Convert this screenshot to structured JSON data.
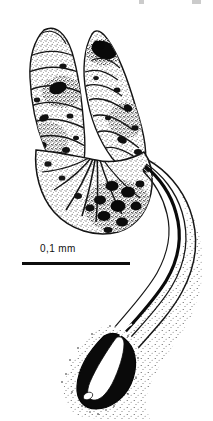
{
  "figure": {
    "domain": "scientific-illustration",
    "technique": "ink stipple and line drawing",
    "background_color": "#ffffff",
    "ink_color": "#111111",
    "width_px": 213,
    "height_px": 421
  },
  "scalebar": {
    "label": "0,1 mm",
    "value": 0.1,
    "unit": "mm",
    "bar_length_px": 108,
    "bar_x_px": 22,
    "bar_y_px": 264,
    "label_x_px": 40,
    "label_y_px": 243,
    "color": "#0d0d0d"
  },
  "parts": {
    "left_lobe": {
      "name": "left lobe",
      "description": "elongate club-shaped stippled lobe with transverse striations and dark granules"
    },
    "right_lobe": {
      "name": "right lobe",
      "description": "elongate curved stippled lobe with large dark nucleus near apex"
    },
    "basal_body": {
      "name": "basal body",
      "description": "fan-shaped basal region with radiating folds and coarse dark granules"
    },
    "duct": {
      "name": "efferent duct",
      "description": "long sinuous duct with parallel walls, stippled sheath and dark inner lumen"
    },
    "terminal_bulb": {
      "name": "terminal bulb",
      "description": "dark solid terminal swelling enclosing a pale central lumen"
    }
  },
  "top_fragments": {
    "note": "faint cropped descenders of text from the line above",
    "count": 2
  }
}
